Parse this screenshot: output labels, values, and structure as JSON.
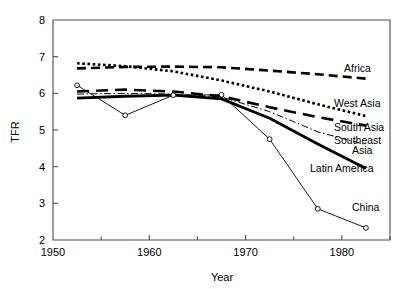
{
  "chart_data": {
    "type": "line",
    "title": "",
    "xlabel": "Year",
    "ylabel": "TFR",
    "xlim": [
      1950,
      1985
    ],
    "ylim": [
      2,
      8
    ],
    "grid": false,
    "legend_position": "right-inline-labels",
    "x_ticks": [
      1950,
      1960,
      1970,
      1980
    ],
    "x_tick_labels": [
      "1950",
      "1960",
      "1970",
      "1980"
    ],
    "x_minor_ticks": [
      1955,
      1965,
      1975,
      1985
    ],
    "y_ticks": [
      2,
      3,
      4,
      5,
      6,
      7,
      8
    ],
    "y_tick_labels": [
      "2",
      "3",
      "4",
      "5",
      "6",
      "7",
      "8"
    ],
    "series": [
      {
        "name": "Africa",
        "label": "Africa",
        "style": "dashed",
        "x": [
          1952.5,
          1957.5,
          1962.5,
          1967.5,
          1972.5,
          1977.5,
          1982.5
        ],
        "values": [
          6.68,
          6.72,
          6.73,
          6.71,
          6.62,
          6.52,
          6.4
        ]
      },
      {
        "name": "West Asia",
        "label": "West Asia",
        "style": "dotted",
        "x": [
          1952.5,
          1957.5,
          1962.5,
          1967.5,
          1972.5,
          1977.5,
          1982.5
        ],
        "values": [
          6.82,
          6.74,
          6.6,
          6.35,
          6.05,
          5.7,
          5.38
        ]
      },
      {
        "name": "South Asia",
        "label": "South Asia",
        "style": "long-dashed",
        "x": [
          1952.5,
          1957.5,
          1962.5,
          1967.5,
          1972.5,
          1977.5,
          1982.5
        ],
        "values": [
          6.05,
          6.1,
          6.05,
          5.92,
          5.62,
          5.35,
          5.12
        ]
      },
      {
        "name": "Southeast Asia",
        "label": "Southeast\nAsia",
        "label_line1": "Southeast",
        "label_line2": "Asia",
        "style": "dash-dot-thin",
        "x": [
          1952.5,
          1957.5,
          1962.5,
          1967.5,
          1972.5,
          1977.5,
          1982.5
        ],
        "values": [
          5.98,
          6.0,
          5.98,
          5.9,
          5.5,
          4.95,
          4.6
        ]
      },
      {
        "name": "Latin America",
        "label": "Latin America",
        "style": "thick-solid",
        "x": [
          1952.5,
          1957.5,
          1962.5,
          1967.5,
          1972.5,
          1977.5,
          1982.5
        ],
        "values": [
          5.87,
          5.92,
          5.95,
          5.85,
          5.32,
          4.62,
          3.95
        ]
      },
      {
        "name": "China",
        "label": "China",
        "style": "thin-solid-markers",
        "markers": "open-circle",
        "x": [
          1952.5,
          1957.5,
          1962.5,
          1967.5,
          1972.5,
          1977.5,
          1982.5
        ],
        "values": [
          6.22,
          5.4,
          5.95,
          5.96,
          4.75,
          2.85,
          2.33
        ]
      }
    ]
  },
  "axes": {
    "y_title": "TFR",
    "x_title": "Year"
  }
}
